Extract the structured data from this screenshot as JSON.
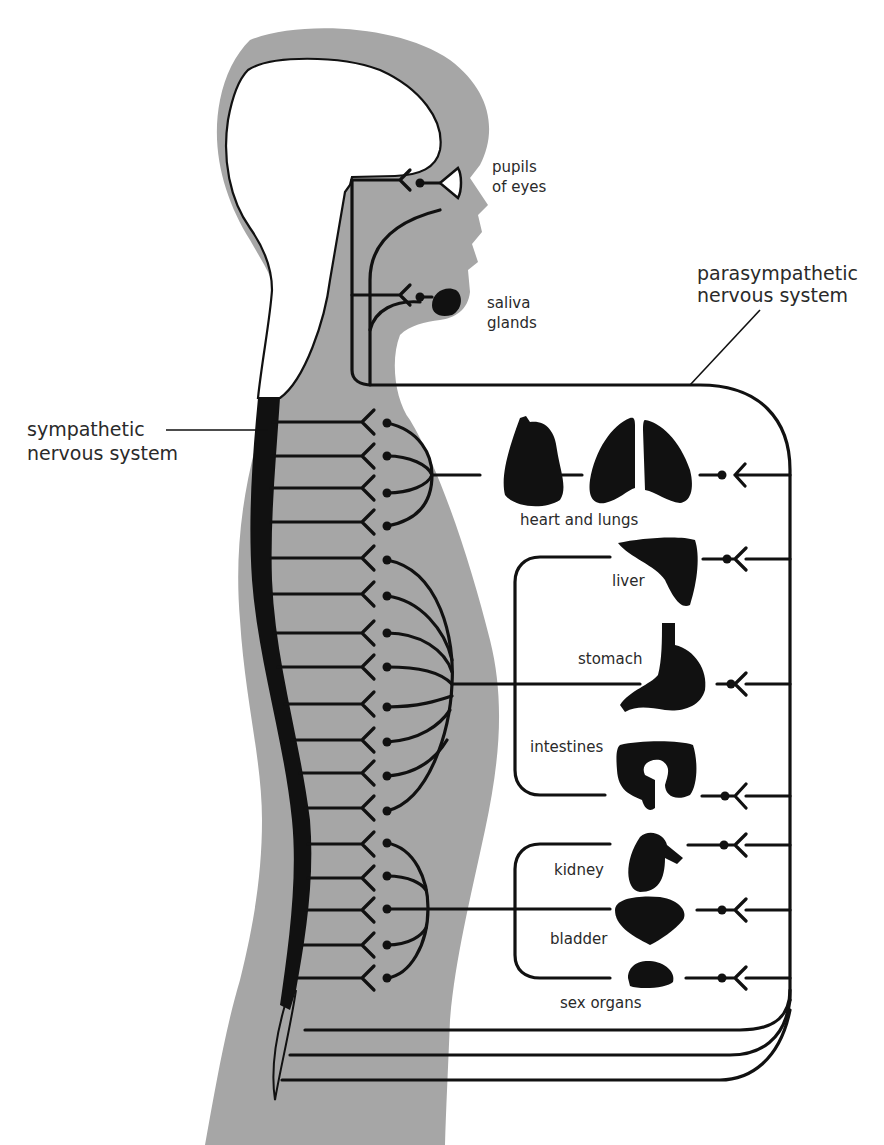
{
  "diagram": {
    "colors": {
      "body_fill": "#a6a6a6",
      "ink": "#111111",
      "background": "#ffffff",
      "label_text": "#2a2a2a"
    },
    "systems": {
      "sympathetic": {
        "label_line1": "sympathetic",
        "label_line2": "nervous system"
      },
      "parasympathetic": {
        "label_line1": "parasympathetic",
        "label_line2": "nervous system"
      }
    },
    "organs": [
      {
        "id": "pupils",
        "label_line1": "pupils",
        "label_line2": "of eyes"
      },
      {
        "id": "saliva",
        "label_line1": "saliva",
        "label_line2": "glands"
      },
      {
        "id": "heart-lungs",
        "label": "heart and lungs"
      },
      {
        "id": "liver",
        "label": "liver"
      },
      {
        "id": "stomach",
        "label": "stomach"
      },
      {
        "id": "intestines",
        "label": "intestines"
      },
      {
        "id": "kidney",
        "label": "kidney"
      },
      {
        "id": "bladder",
        "label": "bladder"
      },
      {
        "id": "sex-organs",
        "label": "sex organs"
      }
    ]
  }
}
